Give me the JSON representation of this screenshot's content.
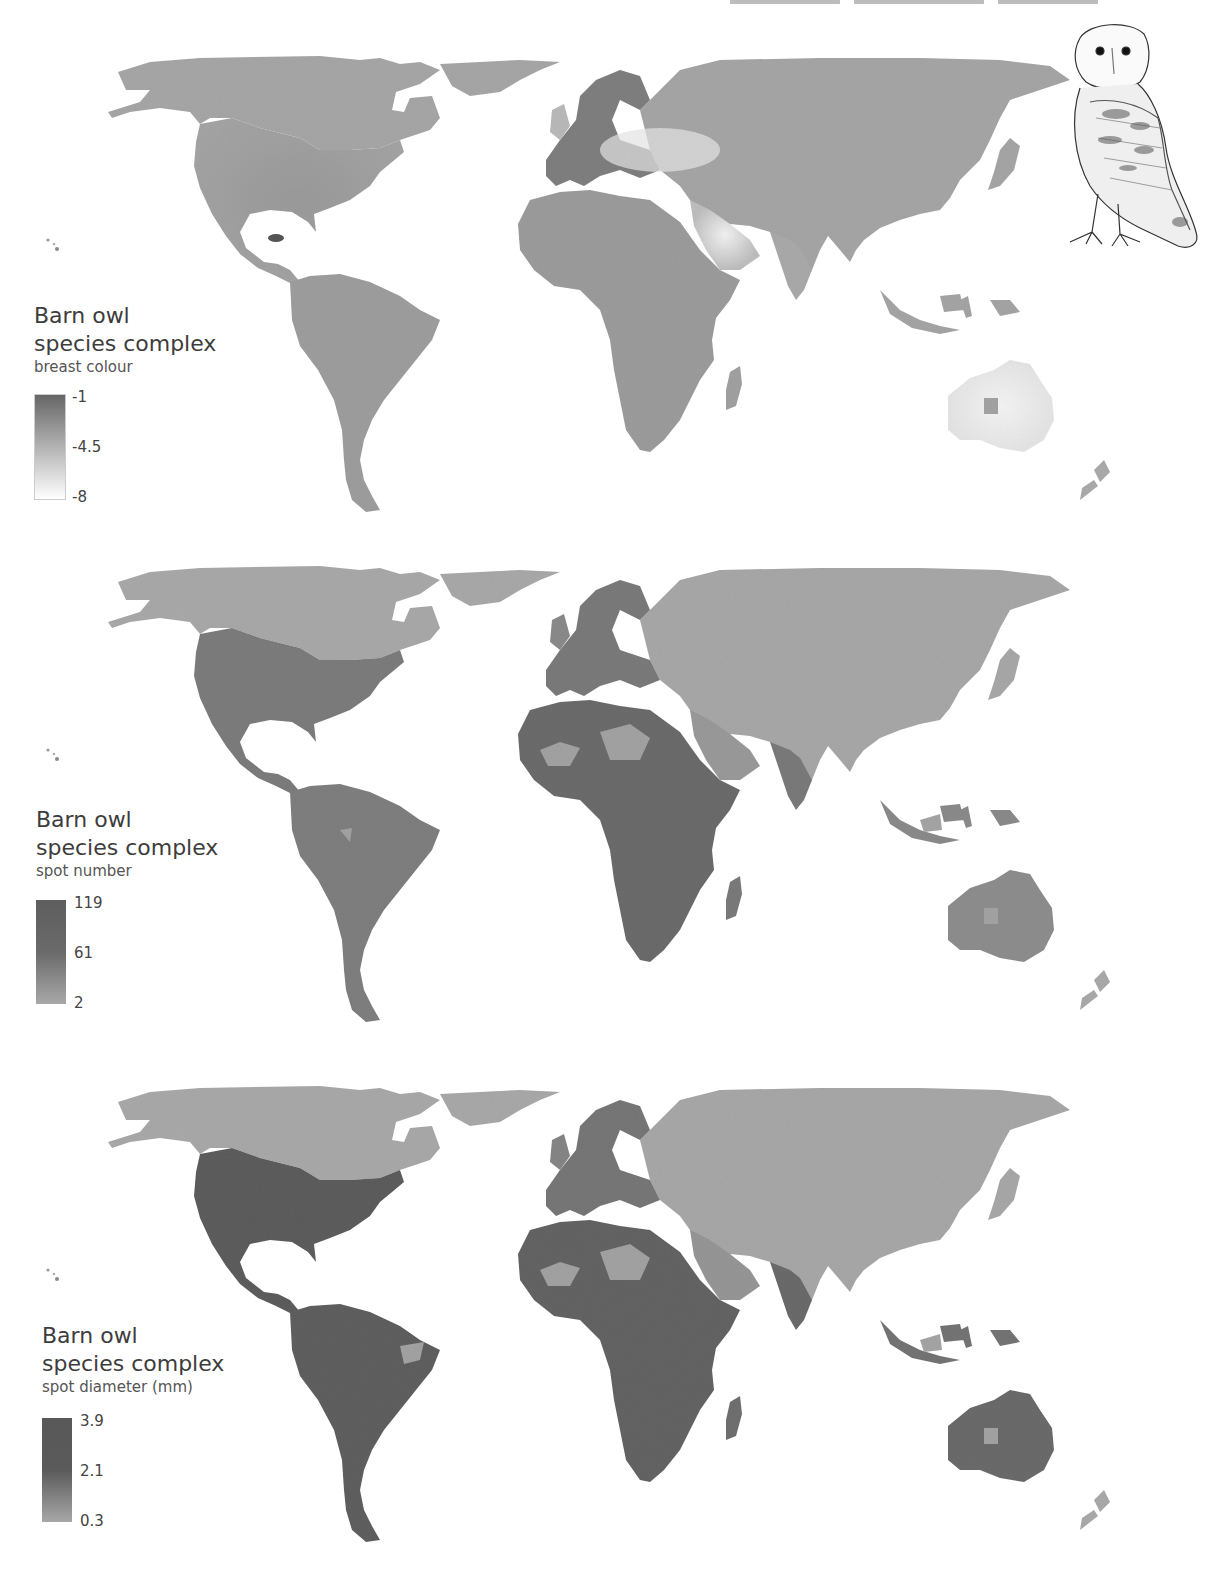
{
  "figure": {
    "header_text_clipped": true,
    "illustration": "barn-owl-sketch"
  },
  "maps": [
    {
      "legend": {
        "title_line1": "Barn owl",
        "title_line2": "species complex",
        "variable": "breast colour",
        "ticks": {
          "max": "-1",
          "mid": "-4.5",
          "min": "-8"
        },
        "color_max": "#6b6b6b",
        "color_min": "#ffffff"
      }
    },
    {
      "legend": {
        "title_line1": "Barn owl",
        "title_line2": "species complex",
        "variable": "spot number",
        "ticks": {
          "max": "119",
          "mid": "61",
          "min": "2"
        },
        "color_max": "#5e5e5e",
        "color_min": "#a8a8a8"
      }
    },
    {
      "legend": {
        "title_line1": "Barn owl",
        "title_line2": "species complex",
        "variable": "spot diameter (mm)",
        "ticks": {
          "max": "3.9",
          "mid": "2.1",
          "min": "0.3"
        },
        "color_max": "#555555",
        "color_min": "#a8a8a8"
      }
    }
  ],
  "colors": {
    "no_data_land": "#a9a9a9",
    "background": "#ffffff"
  }
}
